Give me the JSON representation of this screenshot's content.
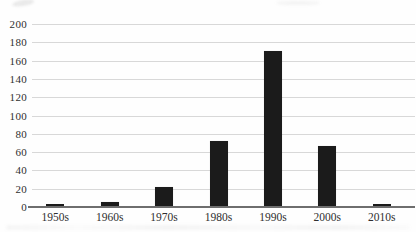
{
  "chart_data": {
    "type": "bar",
    "title": "",
    "xlabel": "",
    "ylabel": "",
    "categories": [
      "1950s",
      "1960s",
      "1970s",
      "1980s",
      "1990s",
      "2000s",
      "2010s"
    ],
    "values": [
      3,
      5,
      22,
      72,
      171,
      67,
      3
    ],
    "ylim": [
      0,
      200
    ],
    "ytick_step": 20,
    "y_ticks": [
      0,
      20,
      40,
      60,
      80,
      100,
      120,
      140,
      160,
      180,
      200
    ],
    "grid": "horizontal-only",
    "legend_position": "none",
    "colors": {
      "bar": "#1b1b1b",
      "gridline": "#d8d8d8",
      "axis_line": "#6e6e6e",
      "tick_label": "#2f2f2f",
      "background": "#fefefe"
    }
  }
}
